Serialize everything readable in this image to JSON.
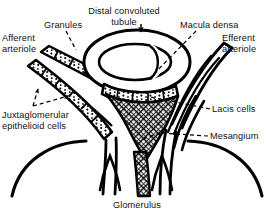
{
  "figure": {
    "type": "anatomical-line-diagram",
    "width": 274,
    "height": 218,
    "background_color": "#ffffff",
    "ink_color": "#000000"
  },
  "labels": {
    "afferent_arteriole": "Afferent\narteriole",
    "granules": "Granules",
    "distal_convoluted_tubule": "Distal convoluted\ntubule",
    "macula_densa": "Macula densa",
    "efferent_arteriole": "Efferent\narteriole",
    "juxtaglomerular_epithelioid_cells": "Juxtaglomerular\nepithelioid cells",
    "lacis_cells": "Lacis cells",
    "mesangium": "Mesangium",
    "glomerulus": "Glomerulus"
  },
  "structures": [
    {
      "name": "afferent-arteriole",
      "fill": "stippled-granular",
      "side": "left"
    },
    {
      "name": "efferent-arteriole",
      "fill": "plain-double-line",
      "side": "right"
    },
    {
      "name": "distal-convoluted-tubule",
      "fill": "outline-oval-ring",
      "side": "top-center"
    },
    {
      "name": "macula-densa",
      "fill": "stippled-granular",
      "side": "center"
    },
    {
      "name": "lacis-cells",
      "fill": "crosshatch-lattice",
      "side": "center"
    },
    {
      "name": "mesangium",
      "fill": "crosshatch-lattice",
      "side": "center-lower"
    },
    {
      "name": "glomerulus",
      "fill": "outline-arcs",
      "side": "bottom"
    }
  ],
  "leaders": [
    {
      "name": "granules-leader",
      "style": "dashed",
      "arrow": false
    },
    {
      "name": "dct-leader",
      "style": "solid-arrow-down",
      "arrow": true
    },
    {
      "name": "macula-densa-leader",
      "style": "dashed",
      "arrow": false
    },
    {
      "name": "jg-leader-upper",
      "style": "dashed",
      "arrow": true
    },
    {
      "name": "jg-leader-lower",
      "style": "dashed",
      "arrow": true
    },
    {
      "name": "lacis-cells-leader",
      "style": "dashed",
      "arrow": false
    },
    {
      "name": "mesangium-leader",
      "style": "dashed",
      "arrow": false
    }
  ]
}
